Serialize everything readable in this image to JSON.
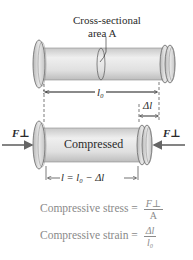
{
  "diagram": {
    "top_label_line1": "Cross-sectional",
    "top_label_line2": "area A",
    "original_length": "l₀",
    "delta_length": "Δl",
    "force_left": "F⊥",
    "force_right": "F⊥",
    "compressed_label": "Compressed",
    "compressed_length": "l = l₀ − Δl"
  },
  "equations": {
    "stress_label": "Compressive stress =",
    "stress_num": "F⊥",
    "stress_den": "A",
    "strain_label": "Compressive strain =",
    "strain_num": "Δl",
    "strain_den": "l₀"
  },
  "colors": {
    "body": "#e2e2e2",
    "outline": "#6a6a6a",
    "arrow": "#555555",
    "equation_text": "#8a8a8a"
  }
}
